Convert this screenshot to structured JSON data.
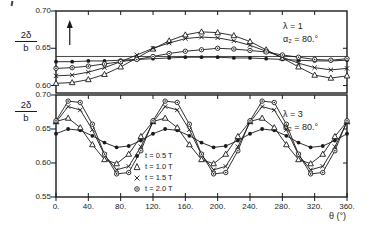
{
  "figure": {
    "background": "#ffffff",
    "ink_color": "#1a1a1a",
    "x_axis_label": "θ (°)",
    "y_axis_label": {
      "numerator": "2δ",
      "denominator": "b"
    }
  },
  "legend": {
    "position": "inside-bottom-panel-center-right",
    "items": [
      {
        "marker": "filled-circle",
        "label": "t = 0.5 T"
      },
      {
        "marker": "open-triangle",
        "label": "t = 1.0 T"
      },
      {
        "marker": "x-cross",
        "label": "t = 1.5 T"
      },
      {
        "marker": "circle-dot",
        "label": "t = 2.0 T"
      }
    ]
  },
  "chart_data": [
    {
      "type": "line",
      "panel": "top",
      "annotation_line1": "λ = 1",
      "annotation_line2": "α₂ = 80.°",
      "xlim": [
        0,
        360
      ],
      "ylim": [
        0.59,
        0.7
      ],
      "grid": false,
      "x_ticks": [
        0,
        40,
        80,
        120,
        160,
        200,
        240,
        280,
        320,
        360
      ],
      "y_ticks": [
        {
          "value": 0.7,
          "label": "0.70"
        },
        {
          "value": 0.65,
          "label": "0.65"
        },
        {
          "value": 0.6,
          "label": "0.60"
        }
      ],
      "show_x_tick_labels": false,
      "reference_line": 0.639,
      "arrow_annotation": {
        "x": 17,
        "direction": "up"
      },
      "x": [
        0,
        20,
        40,
        60,
        80,
        100,
        120,
        140,
        160,
        180,
        200,
        220,
        240,
        260,
        280,
        300,
        320,
        340,
        360
      ],
      "series": [
        {
          "name": "t = 0.5 T",
          "marker": "filled-circle",
          "values": [
            0.632,
            0.632,
            0.633,
            0.633,
            0.634,
            0.635,
            0.636,
            0.637,
            0.638,
            0.638,
            0.638,
            0.637,
            0.637,
            0.636,
            0.635,
            0.634,
            0.633,
            0.633,
            0.634
          ]
        },
        {
          "name": "t = 1.0 T",
          "marker": "open-triangle",
          "values": [
            0.603,
            0.604,
            0.608,
            0.615,
            0.625,
            0.637,
            0.649,
            0.66,
            0.668,
            0.672,
            0.671,
            0.667,
            0.659,
            0.648,
            0.637,
            0.625,
            0.614,
            0.61,
            0.613
          ]
        },
        {
          "name": "t = 1.5 T",
          "marker": "x-cross",
          "values": [
            0.613,
            0.614,
            0.618,
            0.624,
            0.632,
            0.641,
            0.65,
            0.657,
            0.663,
            0.665,
            0.664,
            0.66,
            0.654,
            0.646,
            0.638,
            0.63,
            0.624,
            0.621,
            0.623
          ]
        },
        {
          "name": "t = 2.0 T",
          "marker": "circle-dot",
          "values": [
            0.623,
            0.624,
            0.626,
            0.629,
            0.632,
            0.635,
            0.639,
            0.643,
            0.646,
            0.648,
            0.65,
            0.649,
            0.647,
            0.645,
            0.641,
            0.638,
            0.635,
            0.634,
            0.636
          ]
        }
      ]
    },
    {
      "type": "line",
      "panel": "bottom",
      "annotation_line1": "λ = 3",
      "annotation_line2": "α₂ = 80.°",
      "xlim": [
        0,
        360
      ],
      "ylim": [
        0.55,
        0.7
      ],
      "grid": false,
      "x_ticks": [
        0,
        40,
        80,
        120,
        160,
        200,
        240,
        280,
        320,
        360
      ],
      "x_tick_labels": [
        "0.",
        "40.",
        "80.",
        "120.",
        "160.",
        "200.",
        "240.",
        "280.",
        "320.",
        "360."
      ],
      "y_ticks": [
        {
          "value": 0.7,
          "label": "0.70"
        },
        {
          "value": 0.65,
          "label": "0.65"
        },
        {
          "value": 0.6,
          "label": "0.60"
        },
        {
          "value": 0.55,
          "label": "0.55"
        }
      ],
      "show_x_tick_labels": true,
      "x": [
        0,
        15,
        30,
        45,
        60,
        75,
        90,
        105,
        120,
        135,
        150,
        165,
        180,
        195,
        210,
        225,
        240,
        255,
        270,
        285,
        300,
        315,
        330,
        345,
        360
      ],
      "series": [
        {
          "name": "t = 0.5 T",
          "marker": "filled-circle",
          "values": [
            0.643,
            0.65,
            0.648,
            0.64,
            0.63,
            0.623,
            0.625,
            0.633,
            0.643,
            0.65,
            0.648,
            0.64,
            0.63,
            0.623,
            0.625,
            0.633,
            0.643,
            0.65,
            0.648,
            0.64,
            0.63,
            0.623,
            0.625,
            0.633,
            0.643
          ]
        },
        {
          "name": "t = 1.0 T",
          "marker": "open-triangle",
          "values": [
            0.661,
            0.666,
            0.652,
            0.627,
            0.605,
            0.599,
            0.613,
            0.639,
            0.661,
            0.666,
            0.652,
            0.627,
            0.605,
            0.599,
            0.613,
            0.639,
            0.661,
            0.666,
            0.652,
            0.627,
            0.605,
            0.599,
            0.613,
            0.639,
            0.661
          ]
        },
        {
          "name": "t = 1.5 T",
          "marker": "x-cross",
          "values": [
            0.66,
            0.683,
            0.678,
            0.649,
            0.612,
            0.59,
            0.595,
            0.624,
            0.66,
            0.683,
            0.678,
            0.649,
            0.612,
            0.59,
            0.595,
            0.624,
            0.66,
            0.683,
            0.678,
            0.649,
            0.612,
            0.59,
            0.595,
            0.624,
            0.66
          ]
        },
        {
          "name": "t = 2.0 T",
          "marker": "circle-dot",
          "values": [
            0.662,
            0.691,
            0.689,
            0.657,
            0.613,
            0.584,
            0.586,
            0.618,
            0.662,
            0.691,
            0.689,
            0.657,
            0.613,
            0.584,
            0.586,
            0.618,
            0.662,
            0.691,
            0.689,
            0.657,
            0.613,
            0.584,
            0.586,
            0.618,
            0.662
          ]
        }
      ]
    }
  ]
}
